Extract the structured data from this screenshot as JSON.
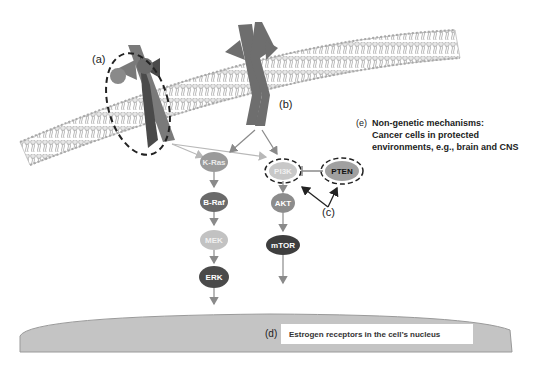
{
  "labels": {
    "a": "(a)",
    "b": "(b)",
    "c": "(c)",
    "d": "(d)",
    "e": "(e)"
  },
  "annotation_e": {
    "line1": "Non-genetic mechanisms:",
    "line2": "Cancer cells in protected",
    "line3": "environments, e.g., brain and CNS"
  },
  "annotation_d": "Estrogen receptors in the cell’s nucleus",
  "nodes": {
    "kras": "K-Ras",
    "braf": "B-Raf",
    "mek": "MEK",
    "erk": "ERK",
    "pi3k": "PI3K",
    "akt": "AKT",
    "mtor": "mTOR",
    "pten": "PTEN"
  },
  "colors": {
    "receptor_dark": "#5a5a5a",
    "receptor_mid": "#7a7a7a",
    "node_light": "#c8c8c8",
    "node_mid": "#8c8c8c",
    "node_dark": "#4a4a4a",
    "nucleus_fill": "#c4c4c4"
  }
}
